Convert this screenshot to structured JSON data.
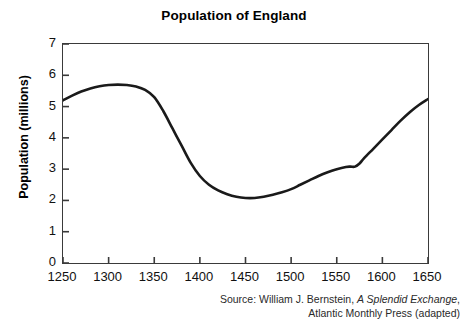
{
  "chart_data": {
    "type": "line",
    "title": "Population of England",
    "xlabel": "",
    "ylabel": "Population (millions)",
    "xlim": [
      1250,
      1650
    ],
    "ylim": [
      0,
      7
    ],
    "grid": false,
    "legend": null,
    "x_ticks": [
      1250,
      1300,
      1350,
      1400,
      1450,
      1500,
      1550,
      1600,
      1650
    ],
    "y_ticks": [
      0,
      1,
      2,
      3,
      4,
      5,
      6,
      7
    ],
    "series": [
      {
        "name": "Population of England (millions)",
        "x": [
          1250,
          1260,
          1270,
          1280,
          1290,
          1300,
          1310,
          1320,
          1330,
          1340,
          1350,
          1360,
          1370,
          1380,
          1390,
          1400,
          1410,
          1420,
          1430,
          1440,
          1450,
          1460,
          1470,
          1480,
          1490,
          1500,
          1510,
          1520,
          1530,
          1540,
          1550,
          1560,
          1565,
          1570,
          1575,
          1580,
          1590,
          1600,
          1610,
          1620,
          1630,
          1640,
          1650
        ],
        "values": [
          5.2,
          5.35,
          5.48,
          5.58,
          5.65,
          5.69,
          5.7,
          5.69,
          5.64,
          5.53,
          5.3,
          4.85,
          4.3,
          3.75,
          3.2,
          2.78,
          2.5,
          2.32,
          2.2,
          2.12,
          2.08,
          2.08,
          2.12,
          2.18,
          2.26,
          2.36,
          2.5,
          2.64,
          2.78,
          2.9,
          3.0,
          3.07,
          3.08,
          3.08,
          3.18,
          3.35,
          3.65,
          3.95,
          4.25,
          4.55,
          4.82,
          5.05,
          5.24
        ]
      }
    ],
    "annotations": []
  },
  "source": {
    "line_1_prefix": "Source: William J. Bernstein, ",
    "line_1_italic": "A Splendid Exchange",
    "line_1_suffix": ",",
    "line_2": "Atlantic Monthly Press (adapted)"
  },
  "style": {
    "line_color": "#1a1a1a",
    "axis_color": "#3a3a3a",
    "background": "#ffffff"
  }
}
